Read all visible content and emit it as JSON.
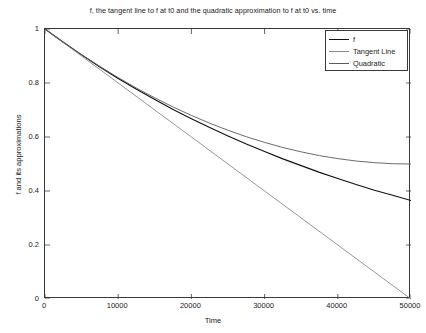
{
  "chart_data": {
    "type": "line",
    "title": "f, the tangent line to f at t0 and the quadratic approximation to f at t0 vs. time",
    "xlabel": "Time",
    "ylabel": "f and its approximations",
    "xlim": [
      0,
      50000
    ],
    "ylim": [
      0,
      1
    ],
    "xticks": [
      0,
      10000,
      20000,
      30000,
      40000,
      50000
    ],
    "xticklabels": [
      "0",
      "10000",
      "20000",
      "30000",
      "40000",
      "50000"
    ],
    "yticks": [
      0,
      0.2,
      0.4,
      0.6,
      0.8,
      1
    ],
    "yticklabels": [
      "0",
      "0.2",
      "0.4",
      "0.6",
      "0.8",
      "1"
    ],
    "grid": false,
    "legend_position": "upper right",
    "box": true,
    "tick_direction": "in",
    "decay_rate": 2.016e-05,
    "series": [
      {
        "name": "f",
        "color": "#111111",
        "formula": "exp(-k*t)",
        "x": [
          0,
          2500,
          5000,
          7500,
          10000,
          12500,
          15000,
          17500,
          20000,
          22500,
          25000,
          27500,
          30000,
          32500,
          35000,
          37500,
          40000,
          42500,
          45000,
          47500,
          50000
        ],
        "values": [
          1.0,
          0.951,
          0.904,
          0.859,
          0.817,
          0.777,
          0.739,
          0.702,
          0.668,
          0.635,
          0.604,
          0.574,
          0.546,
          0.519,
          0.494,
          0.469,
          0.446,
          0.424,
          0.403,
          0.384,
          0.365
        ]
      },
      {
        "name": "Tangent Line",
        "color": "#8a8a8a",
        "formula": "1 - k*t",
        "x": [
          0,
          10000,
          20000,
          30000,
          40000,
          50000
        ],
        "values": [
          1.0,
          0.8,
          0.6,
          0.4,
          0.2,
          0.0
        ]
      },
      {
        "name": "Quadratic",
        "color": "#5a5a5a",
        "formula": "1 - k*t + (k*t)^2/2",
        "x": [
          0,
          2500,
          5000,
          7500,
          10000,
          12500,
          15000,
          17500,
          20000,
          22500,
          25000,
          27500,
          30000,
          32500,
          35000,
          37500,
          40000,
          42500,
          45000,
          47500,
          50000
        ],
        "values": [
          1.0,
          0.951,
          0.905,
          0.861,
          0.82,
          0.781,
          0.745,
          0.711,
          0.68,
          0.651,
          0.625,
          0.601,
          0.58,
          0.561,
          0.545,
          0.531,
          0.52,
          0.511,
          0.505,
          0.501,
          0.5
        ]
      }
    ]
  },
  "legend": {
    "entries": [
      {
        "label": "f"
      },
      {
        "label": "Tangent Line"
      },
      {
        "label": "Quadratic"
      }
    ]
  }
}
